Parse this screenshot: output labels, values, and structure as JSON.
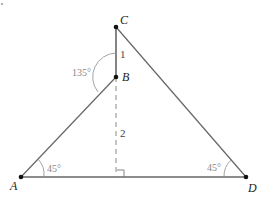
{
  "diagram": {
    "points": {
      "A": {
        "label": "A"
      },
      "B": {
        "label": "B"
      },
      "C": {
        "label": "C"
      },
      "D": {
        "label": "D"
      }
    },
    "segment_labels": {
      "CB": "1",
      "B_to_foot": "2"
    },
    "angles": {
      "at_A": "45°",
      "at_D": "45°",
      "at_B": "135°"
    },
    "colors": {
      "line": "#666666",
      "point": "#111111",
      "angle_arc": "#999999"
    }
  }
}
